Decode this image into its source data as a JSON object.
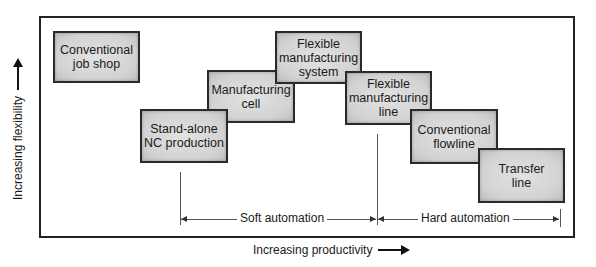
{
  "diagram": {
    "axes": {
      "x_label": "Increasing productivity",
      "y_label": "Increasing flexibility"
    },
    "boxes": [
      {
        "id": "conventional-job-shop",
        "label": "Conventional\njob shop"
      },
      {
        "id": "stand-alone-nc",
        "label": "Stand-alone\nNC production"
      },
      {
        "id": "manufacturing-cell",
        "label": "Manufacturing\ncell"
      },
      {
        "id": "fms",
        "label": "Flexible\nmanufacturing\nsystem"
      },
      {
        "id": "fml",
        "label": "Flexible\nmanufacturing\nline"
      },
      {
        "id": "conventional-flowline",
        "label": "Conventional\nflowline"
      },
      {
        "id": "transfer-line",
        "label": "Transfer\nline"
      }
    ],
    "ranges": [
      {
        "id": "soft-automation",
        "label": "Soft automation"
      },
      {
        "id": "hard-automation",
        "label": "Hard automation"
      }
    ]
  }
}
